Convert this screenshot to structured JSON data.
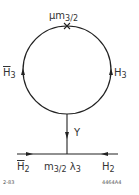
{
  "diagram": {
    "loop": {
      "top_label": {
        "prefix": "μm",
        "sub": "3/2"
      },
      "left_label": {
        "main": "H",
        "sub": "3",
        "bar": true
      },
      "right_label": {
        "main": "H",
        "sub": "3",
        "bar": false
      },
      "vertex_marker": "cross-icon"
    },
    "propagator": {
      "label": "Y"
    },
    "bottom_line": {
      "left_label": {
        "main": "H",
        "sub": "2",
        "bar": true
      },
      "center_label": {
        "prefix": "m",
        "sub": "3/2",
        "suffix": "λ",
        "suffix_sub": "3"
      },
      "right_label": {
        "main": "H",
        "sub": "2",
        "bar": false
      }
    },
    "footer": {
      "left_code": "2-83",
      "right_code": "4464A4"
    },
    "colors": {
      "stroke": "#222222",
      "background": "#ffffff"
    }
  }
}
